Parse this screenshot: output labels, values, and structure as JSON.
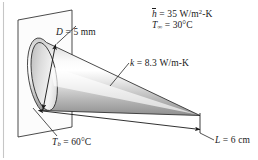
{
  "figure": {
    "type": "engineering-schematic",
    "background_color": "#ffffff",
    "line_color": "#1a1a1a",
    "cone_fill_light": "#fdfdfd",
    "cone_fill_mid": "#d8d8d8",
    "cone_fill_dark": "#9a9a9a",
    "wall_fill": "#fbfbfb"
  },
  "labels": {
    "convection_coefficient": {
      "symbol": "h",
      "overbar": true,
      "equals": "=",
      "value": "35",
      "units_main": "W/m",
      "units_exponent": "2",
      "units_tail": "-K",
      "full_text": "h = 35 W/m2-K"
    },
    "ambient_temperature": {
      "symbol": "T",
      "subscript": "∞",
      "equals": "=",
      "value": "30",
      "units": "°C",
      "full_text": "T∞ = 30°C"
    },
    "diameter": {
      "symbol": "D",
      "equals": "=",
      "value": "5",
      "units": "mm",
      "full_text": "D = 5 mm"
    },
    "conductivity": {
      "symbol": "k",
      "equals": "=",
      "value": "8.3",
      "units": "W/m-K",
      "full_text": "k = 8.3 W/m-K"
    },
    "base_temperature": {
      "symbol": "T",
      "subscript": "b",
      "equals": "=",
      "value": "60",
      "units": "°C",
      "full_text": "Tb = 60°C"
    },
    "length": {
      "symbol": "L",
      "equals": "=",
      "value": "6",
      "units": "cm",
      "full_text": "L = 6 cm"
    }
  }
}
